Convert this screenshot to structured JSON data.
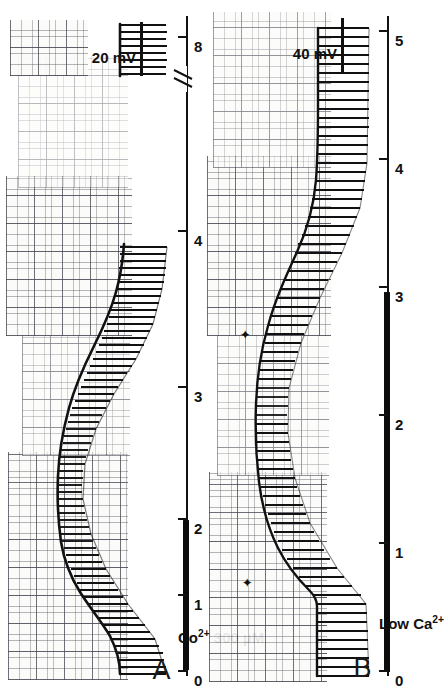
{
  "figure": {
    "background_color": "#ffffff",
    "ink_color": "#111111",
    "paper_color": "#fbfbfa",
    "orientation": "rotated-90-counterclockwise"
  },
  "panels": [
    {
      "id": "A",
      "letter": "A",
      "calibration": {
        "label": "20 mV",
        "value": 20,
        "unit": "mV"
      },
      "treatment": {
        "label": "Co2+  300 µM",
        "ion": "Co",
        "charge": "2+",
        "concentration": "300 µM"
      },
      "axis": {
        "label": "",
        "ticks": [
          0,
          1,
          2,
          3,
          4,
          8
        ],
        "tick_labels": [
          "0",
          "1",
          "2",
          "3",
          "4",
          "8"
        ],
        "has_break": true,
        "break_between": [
          4,
          8
        ],
        "range": [
          0,
          8
        ]
      },
      "bar": {
        "from": 0.08,
        "to": 2.05
      },
      "markers": []
    },
    {
      "id": "B",
      "letter": "B",
      "calibration": {
        "label": "40 mV",
        "value": 40,
        "unit": "mV"
      },
      "treatment": {
        "label": "Low  Ca2+",
        "ion": "Ca",
        "charge": "2+",
        "concentration": "Low"
      },
      "axis": {
        "label": "",
        "ticks": [
          0,
          1,
          2,
          3,
          4,
          5
        ],
        "tick_labels": [
          "0",
          "1",
          "2",
          "3",
          "4",
          "5"
        ],
        "has_break": false,
        "range": [
          0,
          5
        ]
      },
      "bar": {
        "from": 0.05,
        "to": 2.95
      },
      "markers": [
        {
          "name": "arrow-marker-1",
          "at": 0.62,
          "glyph": "✦"
        },
        {
          "name": "arrow-marker-2",
          "at": 2.62,
          "glyph": "✦"
        }
      ]
    }
  ],
  "chart_data": {
    "type": "line",
    "title": "",
    "xlabel": "time (min)",
    "ylabel": "membrane potential (mV)",
    "panels": [
      {
        "name": "A",
        "xlim": [
          0,
          8
        ],
        "axis_break": [
          4.45,
          7.6
        ],
        "baseline_mV": {
          "x": [
            0.0,
            0.15,
            0.3,
            0.45,
            0.6,
            0.75,
            0.9,
            1.05,
            1.2,
            1.35,
            1.5,
            1.65,
            1.8,
            1.95,
            2.1,
            2.25,
            2.4,
            2.55,
            2.7,
            2.85,
            3.0,
            3.15,
            3.3,
            3.45,
            3.6,
            3.75,
            3.9,
            4.05,
            4.2,
            4.35,
            7.7,
            7.85,
            8.0,
            8.15
          ],
          "y": [
            -72,
            -72,
            -71,
            -70,
            -68,
            -64,
            -58,
            -52,
            -47,
            -43,
            -40,
            -38,
            -36,
            -35,
            -34,
            -34,
            -34,
            -35,
            -36,
            -38,
            -40,
            -43,
            -46,
            -50,
            -54,
            -58,
            -62,
            -66,
            -69,
            -71,
            -71,
            -72,
            -72,
            -72
          ]
        },
        "event_amplitude_mV": {
          "x": [
            0.0,
            0.3,
            0.6,
            0.9,
            1.2,
            1.5,
            1.8,
            2.1,
            2.4,
            2.7,
            3.0,
            3.3,
            3.6,
            3.9,
            4.2,
            4.35,
            7.7,
            8.0,
            8.15
          ],
          "y": [
            46,
            45,
            43,
            40,
            35,
            29,
            24,
            20,
            18,
            18,
            20,
            24,
            29,
            35,
            42,
            45,
            45,
            46,
            46
          ]
        },
        "event_count": 64,
        "calibration_bar_mV": 20
      },
      {
        "name": "B",
        "xlim": [
          0,
          5
        ],
        "axis_break": null,
        "baseline_mV": {
          "x": [
            0.0,
            0.2,
            0.4,
            0.55,
            0.62,
            0.7,
            0.85,
            1.0,
            1.2,
            1.4,
            1.6,
            1.8,
            2.0,
            2.2,
            2.4,
            2.6,
            2.62,
            2.8,
            3.0,
            3.2,
            3.4,
            3.6,
            3.8,
            4.0,
            4.2,
            4.4,
            4.6,
            4.8,
            5.0
          ],
          "y": [
            -68,
            -68,
            -68,
            -68,
            -67,
            -62,
            -55,
            -50,
            -45,
            -41,
            -38,
            -36,
            -35,
            -34,
            -34,
            -34,
            -34,
            -36,
            -39,
            -43,
            -48,
            -53,
            -58,
            -62,
            -65,
            -67,
            -68,
            -68,
            -68
          ]
        },
        "event_amplitude_mV": {
          "x": [
            0.0,
            0.2,
            0.4,
            0.6,
            0.62,
            0.8,
            1.0,
            1.3,
            1.6,
            1.9,
            2.2,
            2.5,
            2.62,
            2.9,
            3.2,
            3.5,
            3.8,
            4.1,
            4.4,
            4.7,
            5.0
          ],
          "y": [
            52,
            52,
            51,
            50,
            49,
            44,
            38,
            31,
            26,
            23,
            21,
            20,
            20,
            22,
            26,
            31,
            37,
            43,
            48,
            51,
            52
          ]
        },
        "event_count": 58,
        "calibration_bar_mV": 40
      }
    ]
  }
}
